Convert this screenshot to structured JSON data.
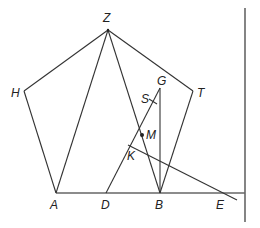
{
  "diagram": {
    "type": "geometry",
    "colors": {
      "line": "#333333",
      "border_line": "#666666",
      "label": "#222222"
    },
    "points": {
      "Z": {
        "label": "Z",
        "x": 108,
        "y": 30
      },
      "H": {
        "label": "H",
        "x": 24,
        "y": 91
      },
      "T": {
        "label": "T",
        "x": 193,
        "y": 91
      },
      "A": {
        "label": "A",
        "x": 56,
        "y": 193
      },
      "B": {
        "label": "B",
        "x": 160,
        "y": 193
      },
      "G": {
        "label": "G",
        "x": 160,
        "y": 88
      },
      "S": {
        "label": "S",
        "x": 153,
        "y": 97
      },
      "M": {
        "label": "M",
        "x": 142,
        "y": 135
      },
      "K": {
        "label": "K",
        "x": 130,
        "y": 146
      },
      "D": {
        "label": "D",
        "x": 106,
        "y": 193
      },
      "E": {
        "label": "E",
        "x": 228,
        "y": 193
      }
    },
    "labels": [
      "Z",
      "H",
      "T",
      "A",
      "B",
      "G",
      "S",
      "M",
      "K",
      "D",
      "E"
    ]
  }
}
